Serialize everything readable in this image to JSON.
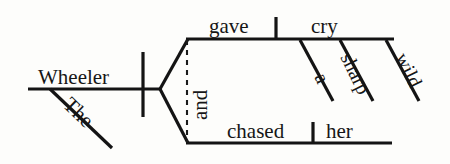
{
  "diagram": {
    "type": "reed-kellogg-sentence-diagram",
    "sentence": "The Wheeler gave a sharp wild cry and chased her",
    "background_color": "#fdfdfb",
    "ink_color": "#141414",
    "words": {
      "subject": "Wheeler",
      "subject_modifier": "The",
      "verb_1": "gave",
      "direct_object_1": "cry",
      "object_modifier_1": "a",
      "object_modifier_2": "sharp",
      "object_modifier_3": "wild",
      "conjunction": "and",
      "verb_2": "chased",
      "direct_object_2": "her"
    },
    "nodes": [
      {
        "name": "subject-word",
        "label": "Wheeler",
        "x": 38,
        "y": 84,
        "rotate": 0,
        "size": "normal"
      },
      {
        "name": "subject-modifier-word",
        "label": "The",
        "x": 62,
        "y": 106,
        "rotate": 44,
        "size": "normal"
      },
      {
        "name": "verb-upper-word",
        "label": "gave",
        "x": 209,
        "y": 33,
        "rotate": 0,
        "size": "normal"
      },
      {
        "name": "object-upper-word",
        "label": "cry",
        "x": 311,
        "y": 33,
        "rotate": 0,
        "size": "normal"
      },
      {
        "name": "object-modifier-a-word",
        "label": "a",
        "x": 314,
        "y": 77,
        "rotate": 64,
        "size": "small"
      },
      {
        "name": "object-modifier-sharp-word",
        "label": "sharp",
        "x": 340,
        "y": 57,
        "rotate": 64,
        "size": "small"
      },
      {
        "name": "object-modifier-wild-word",
        "label": "wild",
        "x": 395,
        "y": 57,
        "rotate": 64,
        "size": "small"
      },
      {
        "name": "conjunction-word",
        "label": "and",
        "x": 207,
        "y": 120,
        "rotate": -90,
        "size": "normal"
      },
      {
        "name": "verb-lower-word",
        "label": "chased",
        "x": 227,
        "y": 138,
        "rotate": 0,
        "size": "normal"
      },
      {
        "name": "object-lower-word",
        "label": "her",
        "x": 326,
        "y": 138,
        "rotate": 0,
        "size": "normal"
      }
    ],
    "strokes": [
      {
        "name": "subject-baseline",
        "kind": "solid",
        "x1": 28,
        "y1": 89,
        "x2": 160,
        "y2": 89
      },
      {
        "name": "subject-predicate-divider",
        "kind": "solid",
        "x1": 143,
        "y1": 52,
        "x2": 143,
        "y2": 117
      },
      {
        "name": "subject-modifier-slant",
        "kind": "solid",
        "x1": 50,
        "y1": 89,
        "x2": 112,
        "y2": 148
      },
      {
        "name": "fork-upper-arm",
        "kind": "solid",
        "x1": 160,
        "y1": 89,
        "x2": 188,
        "y2": 39
      },
      {
        "name": "fork-lower-arm",
        "kind": "solid",
        "x1": 160,
        "y1": 89,
        "x2": 188,
        "y2": 143
      },
      {
        "name": "upper-predicate-baseline",
        "kind": "solid",
        "x1": 186,
        "y1": 39,
        "x2": 394,
        "y2": 39
      },
      {
        "name": "upper-verb-object-divider",
        "kind": "solid",
        "x1": 276,
        "y1": 17,
        "x2": 276,
        "y2": 39
      },
      {
        "name": "object-modifier-a-slant",
        "kind": "solid",
        "x1": 300,
        "y1": 40,
        "x2": 333,
        "y2": 101
      },
      {
        "name": "object-modifier-sharp-slant",
        "kind": "solid",
        "x1": 340,
        "y1": 40,
        "x2": 373,
        "y2": 101
      },
      {
        "name": "object-modifier-wild-slant",
        "kind": "solid",
        "x1": 386,
        "y1": 40,
        "x2": 419,
        "y2": 101
      },
      {
        "name": "lower-predicate-baseline",
        "kind": "solid",
        "x1": 186,
        "y1": 143,
        "x2": 392,
        "y2": 143
      },
      {
        "name": "lower-verb-object-divider",
        "kind": "solid",
        "x1": 313,
        "y1": 122,
        "x2": 313,
        "y2": 143
      },
      {
        "name": "conjunction-dashed-line",
        "kind": "dashed",
        "x1": 187,
        "y1": 40,
        "x2": 187,
        "y2": 142
      }
    ]
  }
}
